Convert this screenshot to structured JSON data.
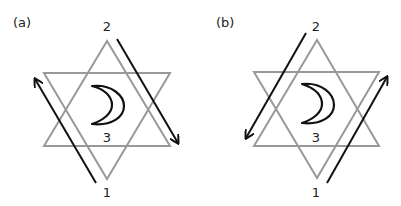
{
  "colors": {
    "star": "#999999",
    "arrow": "#111111",
    "moon": "#111111",
    "text": "#222222"
  },
  "panels": [
    {
      "id": "a",
      "label": "(a)",
      "vertex_labels": {
        "top": "2",
        "bottom": "1",
        "center": "3"
      },
      "arrows": [
        {
          "side": "left",
          "direction": "up",
          "from": "1",
          "toward": "upper-left"
        },
        {
          "side": "right",
          "direction": "down",
          "from": "2",
          "toward": "lower-right"
        }
      ],
      "symbol": "crescent-moon"
    },
    {
      "id": "b",
      "label": "(b)",
      "vertex_labels": {
        "top": "2",
        "bottom": "1",
        "center": "3"
      },
      "arrows": [
        {
          "side": "left",
          "direction": "down",
          "from": "2",
          "toward": "lower-left"
        },
        {
          "side": "right",
          "direction": "up",
          "from": "1",
          "toward": "upper-right"
        }
      ],
      "symbol": "crescent-moon"
    }
  ]
}
